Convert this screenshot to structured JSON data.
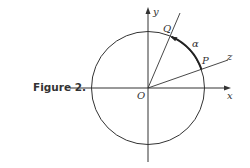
{
  "figure": {
    "caption": "Figure 2.",
    "labels": {
      "origin": "O",
      "x_axis": "x",
      "y_axis": "y",
      "z_axis": "z",
      "point_p": "P",
      "point_q": "Q",
      "arc": "α"
    },
    "colors": {
      "stroke": "#333333",
      "background": "#ffffff"
    }
  }
}
